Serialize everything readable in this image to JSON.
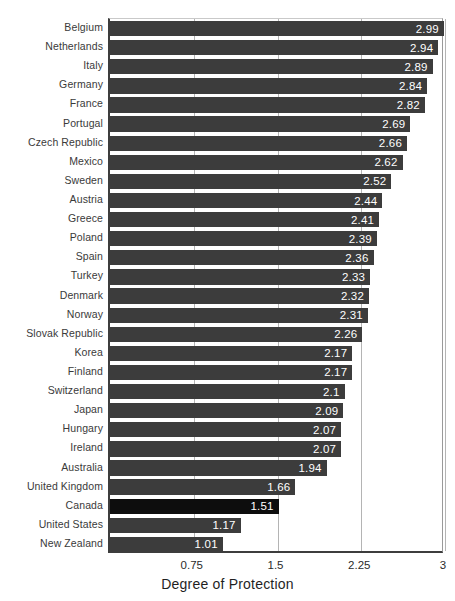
{
  "chart_data": {
    "type": "bar",
    "orientation": "horizontal",
    "title": "",
    "subtitle": "",
    "xlabel": "Degree of Protection",
    "ylabel": "",
    "xlim": [
      0,
      3
    ],
    "ylim": null,
    "grid": true,
    "gridlines_x": [
      0.75,
      1.5,
      2.25,
      3
    ],
    "xticks": [
      0.75,
      1.5,
      2.25,
      3
    ],
    "xtick_labels": [
      "0.75",
      "1.5",
      "2.25",
      "3"
    ],
    "legend": null,
    "legend_position": "none",
    "categories": [
      "Belgium",
      "Netherlands",
      "Italy",
      "Germany",
      "France",
      "Portugal",
      "Czech Republic",
      "Mexico",
      "Sweden",
      "Austria",
      "Greece",
      "Poland",
      "Spain",
      "Turkey",
      "Denmark",
      "Norway",
      "Slovak Republic",
      "Korea",
      "Finland",
      "Switzerland",
      "Japan",
      "Hungary",
      "Ireland",
      "Australia",
      "United Kingdom",
      "Canada",
      "United States",
      "New Zealand"
    ],
    "values": [
      2.99,
      2.94,
      2.89,
      2.84,
      2.82,
      2.69,
      2.66,
      2.62,
      2.52,
      2.44,
      2.41,
      2.39,
      2.36,
      2.33,
      2.32,
      2.31,
      2.26,
      2.17,
      2.17,
      2.1,
      2.09,
      2.07,
      2.07,
      1.94,
      1.66,
      1.51,
      1.17,
      1.01
    ],
    "value_labels": [
      "2.99",
      "2.94",
      "2.89",
      "2.84",
      "2.82",
      "2.69",
      "2.66",
      "2.62",
      "2.52",
      "2.44",
      "2.41",
      "2.39",
      "2.36",
      "2.33",
      "2.32",
      "2.31",
      "2.26",
      "2.17",
      "2.17",
      "2.1",
      "2.09",
      "2.07",
      "2.07",
      "1.94",
      "1.66",
      "1.51",
      "1.17",
      "1.01"
    ],
    "highlighted_category": "Canada",
    "colors": {
      "bar": "#3c3c3c",
      "bar_highlight": "#0d0d0d",
      "value_label": "#ffffff",
      "axis": "#3d3d3d",
      "gridline": "#b4b4b4",
      "category_label": "#3a3a3a",
      "background": "#ffffff"
    }
  }
}
